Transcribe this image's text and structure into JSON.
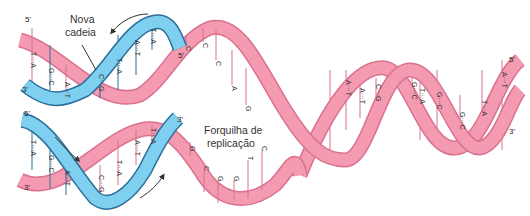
{
  "colors": {
    "parental_strand": "#f49ab1",
    "parental_edge": "#d9718f",
    "new_strand": "#7fd0f0",
    "new_strand_edge": "#2b6f9a",
    "base_line_pink": "#d9718f",
    "base_line_blue": "#2b6f9a",
    "text": "#333333"
  },
  "labels": {
    "new_strand": [
      "Nova",
      "cadeia"
    ],
    "replication_fork": [
      "Forquilha de",
      "replicação"
    ]
  },
  "ends": {
    "top_left_5": "5'",
    "top_left_3": "3'",
    "top_blue_5": "5'",
    "bottom_left_5": "5'",
    "bottom_left_3": "3'",
    "bottom_blue_3": "3'",
    "right_5": "5'",
    "right_3": "3'"
  },
  "top_daughter_pairs": [
    "T-A",
    "G-C",
    "A-T",
    "C-G",
    "T-A",
    "A-T",
    "T-A"
  ],
  "bottom_daughter_pairs": [
    "T-A",
    "G-C",
    "A-T",
    "C-G",
    "T-A",
    "A-T",
    "T-A"
  ],
  "top_single_strand_bases": [
    "C",
    "C",
    "C",
    "A",
    "G"
  ],
  "bottom_single_strand_bases": [
    "G",
    "C",
    "G",
    "G",
    "T",
    "C"
  ],
  "parental_pairs": [
    "G",
    "A-T",
    "T",
    "C-G",
    "A-T",
    "C-G",
    "G-C",
    "T-A",
    "G-C",
    "T-A",
    "G-C",
    "A-T",
    "T-A",
    "A-T"
  ]
}
